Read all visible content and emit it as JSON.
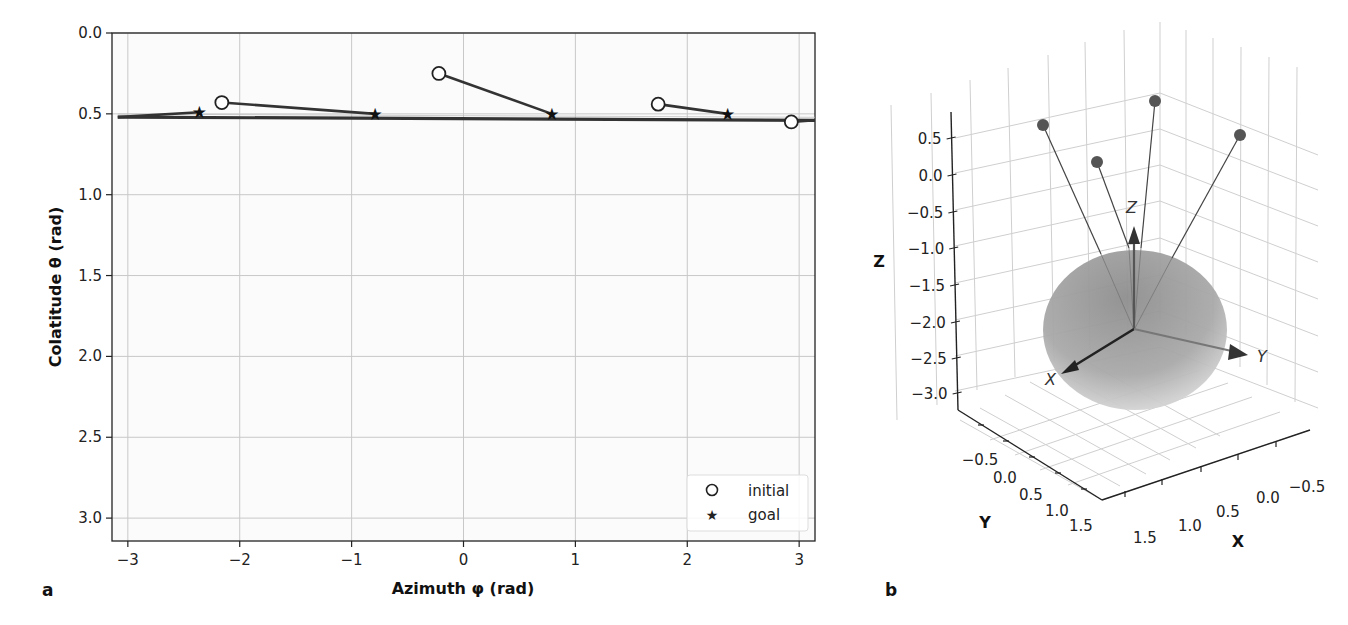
{
  "chart_data": [
    {
      "panel": "a",
      "type": "scatter",
      "xlabel": "Azimuth φ (rad)",
      "ylabel": "Colatitude θ (rad)",
      "xlim": [
        -3.1416,
        3.1416
      ],
      "ylim": [
        3.1416,
        0.0
      ],
      "y_inverted": true,
      "grid": true,
      "x_ticks": [
        -3,
        -2,
        -1,
        0,
        1,
        2,
        3
      ],
      "x_tick_labels": [
        "−3",
        "−2",
        "−1",
        "0",
        "1",
        "2",
        "3"
      ],
      "y_ticks": [
        0.0,
        0.5,
        1.0,
        1.5,
        2.0,
        2.5,
        3.0
      ],
      "y_tick_labels": [
        "0.0",
        "0.5",
        "1.0",
        "1.5",
        "2.0",
        "2.5",
        "3.0"
      ],
      "legend": {
        "position": "lower right",
        "entries": [
          {
            "label": "initial",
            "marker": "open-circle"
          },
          {
            "label": "goal",
            "marker": "star"
          }
        ]
      },
      "series": [
        {
          "name": "initial",
          "marker": "open-circle",
          "points": [
            {
              "phi": -2.16,
              "theta": 0.43
            },
            {
              "phi": -0.22,
              "theta": 0.25
            },
            {
              "phi": 1.74,
              "theta": 0.44
            },
            {
              "phi": 2.93,
              "theta": 0.55
            }
          ]
        },
        {
          "name": "goal",
          "marker": "star",
          "points": [
            {
              "phi": -2.36,
              "theta": 0.49
            },
            {
              "phi": -0.79,
              "theta": 0.5
            },
            {
              "phi": 0.79,
              "theta": 0.5
            },
            {
              "phi": 2.36,
              "theta": 0.5
            }
          ]
        }
      ],
      "trajectories": [
        {
          "from": {
            "phi": -2.16,
            "theta": 0.43
          },
          "to": {
            "phi": -0.79,
            "theta": 0.5
          }
        },
        {
          "from": {
            "phi": -0.22,
            "theta": 0.25
          },
          "to": {
            "phi": 0.79,
            "theta": 0.5
          }
        },
        {
          "from": {
            "phi": 1.74,
            "theta": 0.44
          },
          "to": {
            "phi": 2.36,
            "theta": 0.5
          }
        },
        {
          "from": {
            "phi": 2.93,
            "theta": 0.55
          },
          "to": {
            "phi": 3.14,
            "theta": 0.54
          }
        },
        {
          "from": {
            "phi": -3.09,
            "theta": 0.52
          },
          "to": {
            "phi": -2.36,
            "theta": 0.49
          }
        }
      ],
      "reference_line": {
        "theta_start": 0.52,
        "theta_end": 0.54,
        "phi_range": [
          -3.09,
          3.1416
        ]
      }
    },
    {
      "panel": "b",
      "type": "scatter3d",
      "xlabel": "X",
      "ylabel": "Y",
      "zlabel": "Z",
      "x_tick_labels": [
        "−0.5",
        "0.0",
        "0.5",
        "1.0",
        "1.5"
      ],
      "y_tick_labels": [
        "−0.5",
        "0.0",
        "0.5",
        "1.0",
        "1.5"
      ],
      "z_tick_labels": [
        "0.5",
        "0.0",
        "−0.5",
        "−1.0",
        "−1.5",
        "−2.0",
        "−2.5",
        "−3.0"
      ],
      "zlim": [
        -3.2,
        0.8
      ],
      "grid": true,
      "objects": [
        "sphere (unit, shaded gray) centered near origin",
        "coordinate frame arrows X, Y, Z from center",
        "4 point masses (gray dots) tethered by lines to sphere top"
      ],
      "frame_labels": [
        "X",
        "Y",
        "Z"
      ],
      "points_count": 4
    }
  ],
  "panel_letters": {
    "a": "a",
    "b": "b"
  },
  "legend": {
    "initial": "initial",
    "goal": "goal"
  },
  "colors": {
    "line": "#333333",
    "grid": "#cccccc",
    "sphere": "#9a9a9a",
    "dot": "#555555"
  }
}
